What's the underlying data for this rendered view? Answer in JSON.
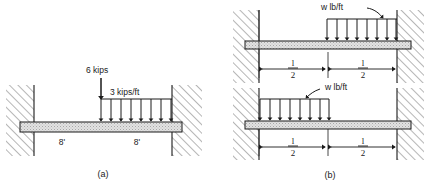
{
  "figure": {
    "caption_a": "(a)",
    "caption_b": "(b)",
    "background": "#ffffff",
    "ink": "#1a1a1a"
  },
  "diagram_a": {
    "name": "fixed-fixed-beam-point-and-distributed-load",
    "point_load_label": "6 kips",
    "distributed_load_label": "3 kips/ft",
    "left_span_label": "8'",
    "right_span_label": "8'",
    "arrow_count": 8,
    "beam_fill": "#d9d9d9",
    "wall_hatch_color": "#808080"
  },
  "diagram_b_top": {
    "name": "fixed-fixed-beam-right-half-udl",
    "distributed_load_label": "w lb/ft",
    "left_dim_numerator": "l",
    "left_dim_denominator": "2",
    "right_dim_numerator": "l",
    "right_dim_denominator": "2",
    "arrow_count": 8,
    "load_side": "right"
  },
  "diagram_b_bottom": {
    "name": "fixed-fixed-beam-left-half-udl",
    "distributed_load_label": "w lb/ft",
    "left_dim_numerator": "l",
    "left_dim_denominator": "2",
    "right_dim_numerator": "l",
    "right_dim_denominator": "2",
    "arrow_count": 8,
    "load_side": "left"
  }
}
